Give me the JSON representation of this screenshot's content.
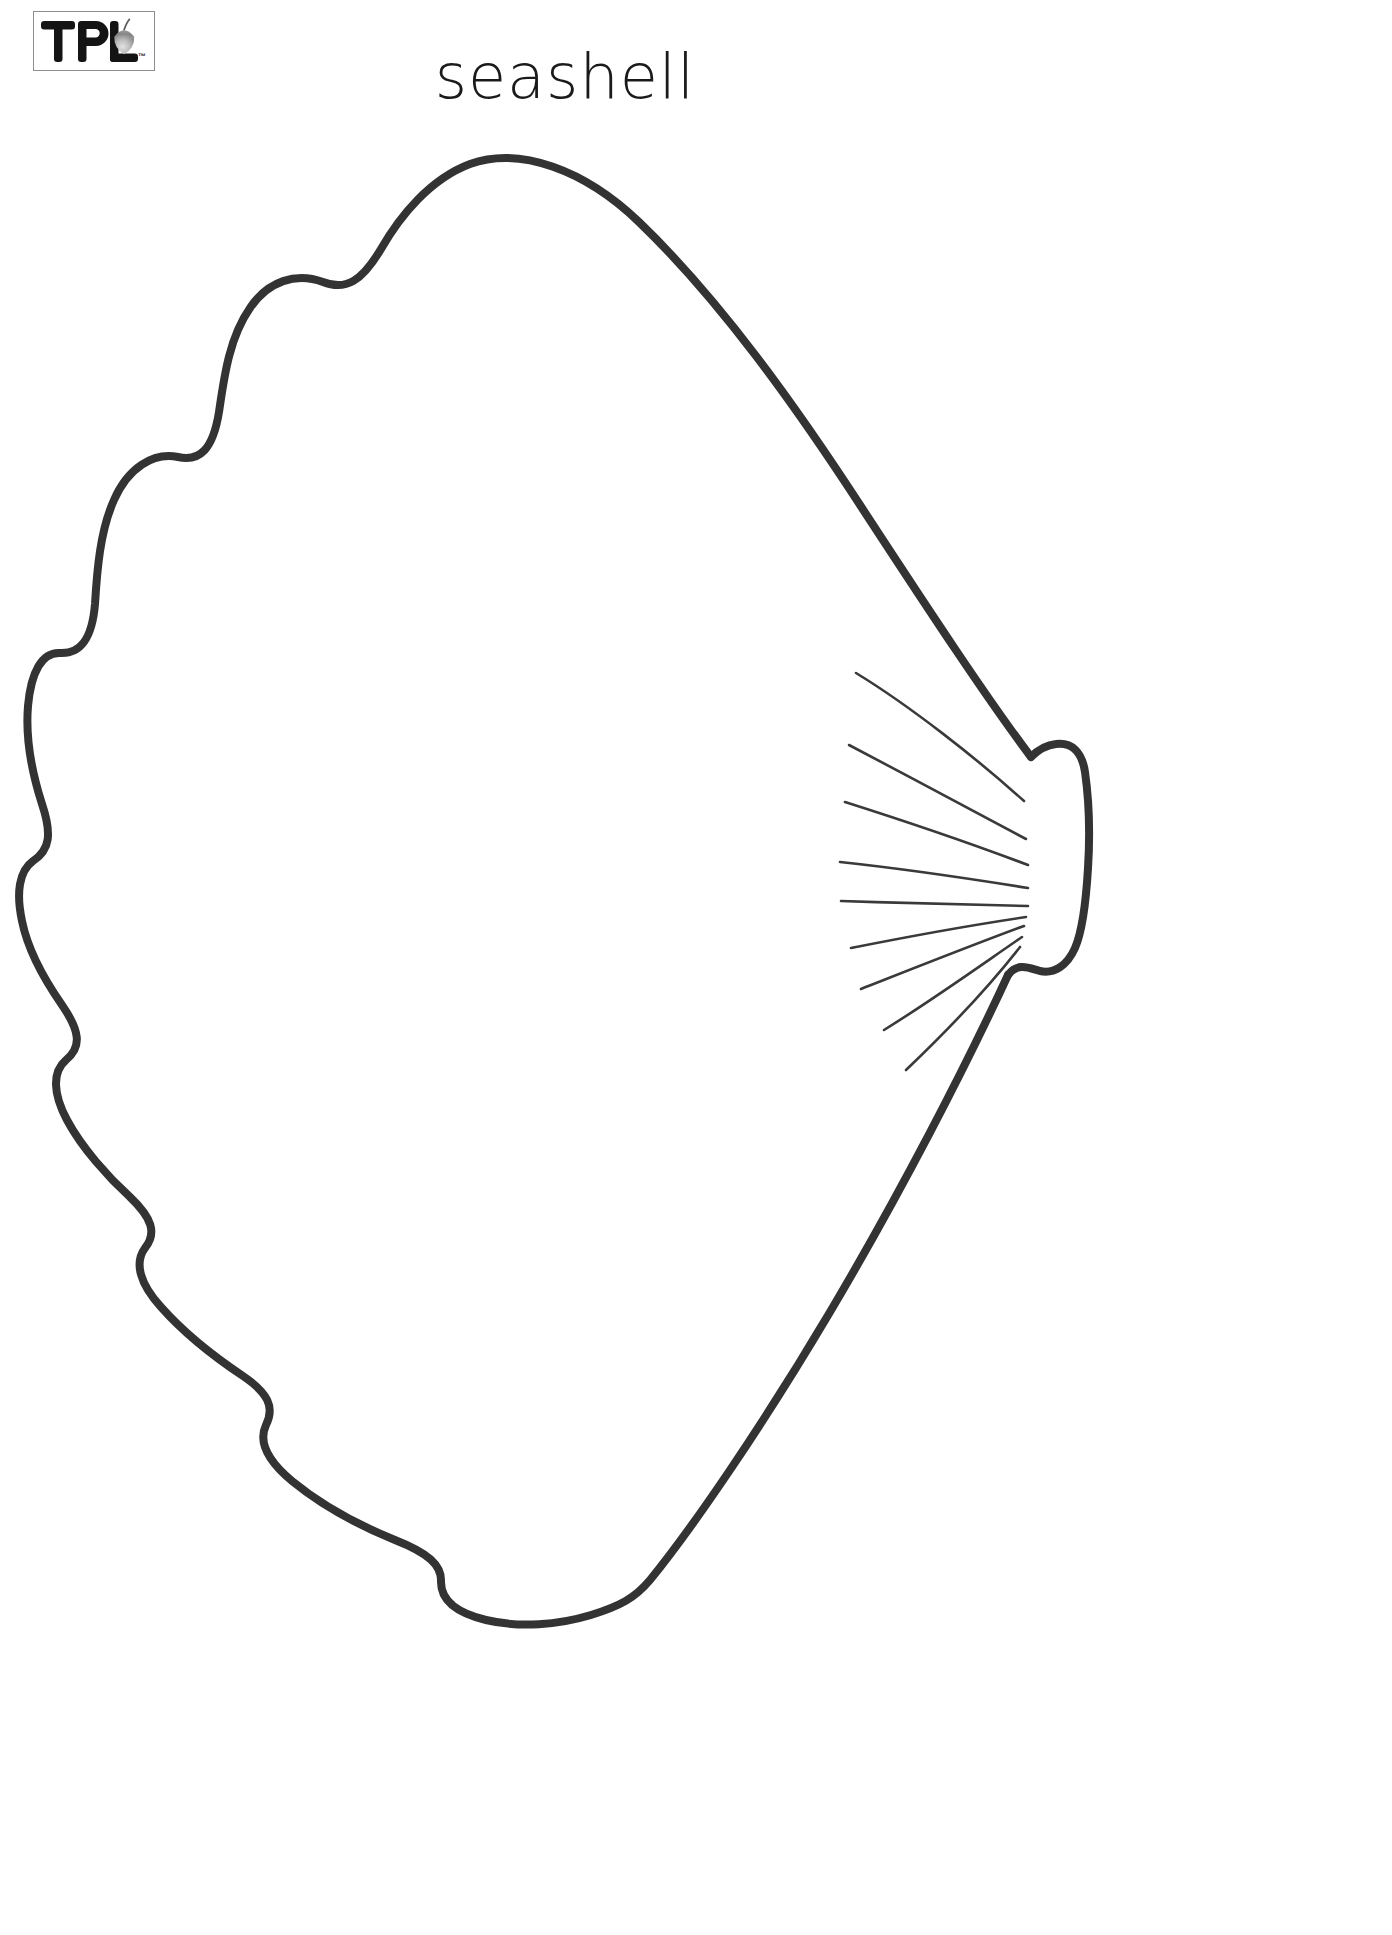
{
  "page": {
    "background_color": "#ffffff",
    "width": 1392,
    "height": 1935
  },
  "logo": {
    "name": "TPL",
    "text": "TPL",
    "trademark": "™",
    "icon": "acorn-icon",
    "border_color": "#8d8d8d",
    "text_color": "#1c1c1c",
    "acorn_cap_color": "#8c8c8c",
    "acorn_body_color": "#b5b5b5"
  },
  "title": {
    "text": "seashell",
    "color": "#1a1a1a"
  },
  "artwork": {
    "name": "seashell-outline",
    "description": "scallop seashell coloring page outline",
    "stroke_color": "#333333",
    "stroke_width": 8,
    "ray_color": "#3a3a3a",
    "ray_count": 9,
    "scallop_count": 8,
    "fill": "none"
  }
}
